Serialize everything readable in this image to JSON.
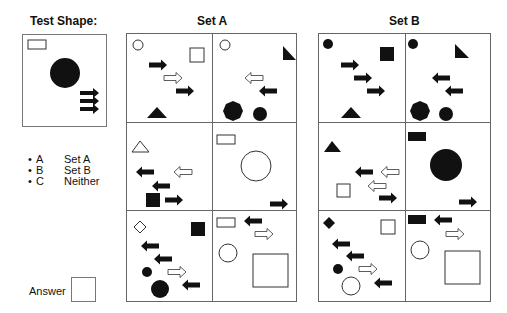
{
  "test_shape": {
    "title": "Test Shape:",
    "shapes": [
      "small-outline-rectangle",
      "large-black-circle",
      "three-black-right-arrows"
    ]
  },
  "set_a": {
    "title": "Set A",
    "cells": [
      {
        "shapes": [
          "small-outline-circle",
          "outline-square",
          "black-right-arrow",
          "outline-right-arrow",
          "black-right-arrow",
          "black-triangle"
        ]
      },
      {
        "shapes": [
          "small-outline-circle",
          "black-right-triangle",
          "outline-left-arrow",
          "black-left-arrow",
          "black-octagon",
          "black-circle"
        ]
      },
      {
        "shapes": [
          "outline-triangle",
          "black-left-arrow",
          "outline-left-arrow",
          "black-left-arrow",
          "black-square",
          "black-right-arrow"
        ]
      },
      {
        "shapes": [
          "outline-rectangle",
          "large-outline-circle",
          "black-right-arrow"
        ]
      },
      {
        "shapes": [
          "outline-diamond",
          "black-square",
          "black-left-arrow",
          "black-left-arrow",
          "small-black-circle",
          "outline-right-arrow",
          "black-circle",
          "black-left-arrow"
        ]
      },
      {
        "shapes": [
          "outline-rectangle",
          "black-left-arrow",
          "outline-right-arrow",
          "outline-circle",
          "large-outline-square"
        ]
      }
    ]
  },
  "set_b": {
    "title": "Set B",
    "cells": [
      {
        "shapes": [
          "small-black-circle",
          "black-square",
          "black-right-arrow",
          "black-right-arrow",
          "black-right-arrow",
          "black-triangle"
        ]
      },
      {
        "shapes": [
          "small-black-circle",
          "black-right-triangle",
          "black-left-arrow",
          "black-left-arrow",
          "black-octagon",
          "black-circle"
        ]
      },
      {
        "shapes": [
          "black-triangle",
          "black-left-arrow",
          "outline-left-arrow",
          "outline-left-arrow",
          "outline-square",
          "black-right-arrow"
        ]
      },
      {
        "shapes": [
          "black-rectangle",
          "large-black-circle",
          "black-right-arrow"
        ]
      },
      {
        "shapes": [
          "black-diamond",
          "outline-square",
          "black-left-arrow",
          "black-left-arrow",
          "small-black-circle",
          "outline-right-arrow",
          "outline-circle",
          "black-left-arrow"
        ]
      },
      {
        "shapes": [
          "black-rectangle",
          "black-left-arrow",
          "outline-right-arrow",
          "outline-circle",
          "large-outline-square"
        ]
      }
    ]
  },
  "options": [
    {
      "key": "A",
      "label": "Set A"
    },
    {
      "key": "B",
      "label": "Set B"
    },
    {
      "key": "C",
      "label": "Neither"
    }
  ],
  "answer": {
    "label": "Answer",
    "value": ""
  },
  "colors": {
    "ink": "#111111",
    "border": "#666666"
  }
}
